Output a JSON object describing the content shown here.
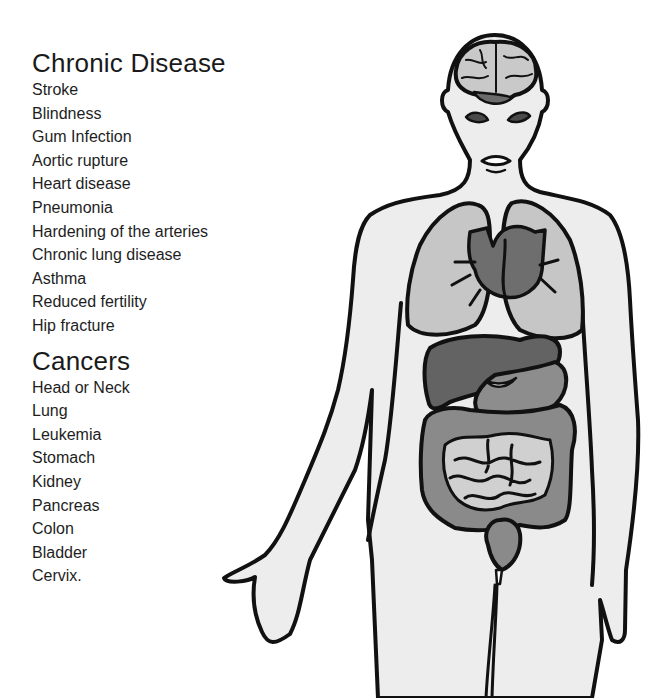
{
  "sections": [
    {
      "title": "Chronic Disease",
      "items": [
        "Stroke",
        "Blindness",
        "Gum Infection",
        "Aortic rupture",
        "Heart disease",
        "Pneumonia",
        "Hardening of the arteries",
        "Chronic lung disease",
        "Asthma",
        "Reduced fertility",
        "Hip fracture"
      ]
    },
    {
      "title": "Cancers",
      "items": [
        "Head or Neck",
        "Lung",
        "Leukemia",
        "Stomach",
        "Kidney",
        "Pancreas",
        "Colon",
        "Bladder",
        "Cervix."
      ]
    }
  ],
  "figure": {
    "organs": [
      "brain",
      "eyes",
      "mouth",
      "lungs",
      "heart",
      "liver",
      "stomach",
      "large-intestine",
      "small-intestine",
      "bladder"
    ],
    "colors": {
      "outline": "#111111",
      "skin": "#ededed",
      "light_organ": "#c4c4c4",
      "mid_organ": "#8a8a8a",
      "dark_organ": "#5e5e5e"
    }
  }
}
